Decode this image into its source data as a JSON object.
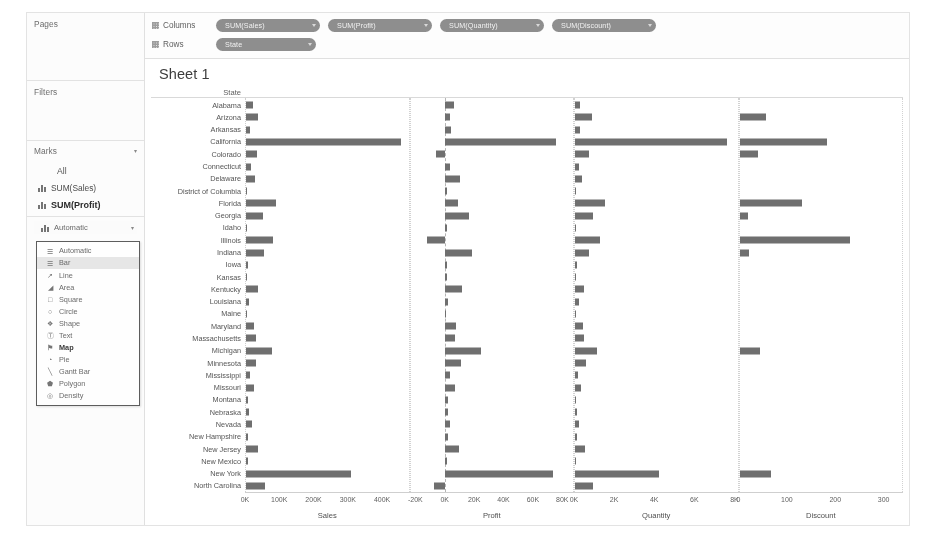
{
  "window": {
    "sheet_title": "Sheet 1"
  },
  "sidebar": {
    "pages": {
      "label": "Pages"
    },
    "filters": {
      "label": "Filters"
    },
    "marks": {
      "label": "Marks",
      "caret": "▾",
      "tabs": [
        {
          "label": "All",
          "icon": "none"
        },
        {
          "label": "SUM(Sales)",
          "icon": "bar-chart-icon"
        },
        {
          "label": "SUM(Profit)",
          "icon": "bar-chart-icon"
        }
      ],
      "marktype_selected": "Automatic",
      "marktype_caret": "▾",
      "dropdown_options": [
        {
          "label": "Automatic",
          "icon": "☰",
          "icon_name": "bar-chart-icon"
        },
        {
          "label": "Bar",
          "icon": "☰",
          "icon_name": "bar-icon",
          "highlighted": true
        },
        {
          "label": "Line",
          "icon": "↗",
          "icon_name": "line-icon"
        },
        {
          "label": "Area",
          "icon": "◢",
          "icon_name": "area-icon"
        },
        {
          "label": "Square",
          "icon": "□",
          "icon_name": "square-icon"
        },
        {
          "label": "Circle",
          "icon": "○",
          "icon_name": "circle-icon"
        },
        {
          "label": "Shape",
          "icon": "❖",
          "icon_name": "shape-icon"
        },
        {
          "label": "Text",
          "icon": "Ⓣ",
          "icon_name": "text-icon"
        },
        {
          "label": "Map",
          "icon": "⚑",
          "icon_name": "map-icon",
          "bold": true
        },
        {
          "label": "Pie",
          "icon": "◔",
          "icon_name": "pie-icon"
        },
        {
          "label": "Gantt Bar",
          "icon": "╲",
          "icon_name": "gantt-bar-icon"
        },
        {
          "label": "Polygon",
          "icon": "⬟",
          "icon_name": "polygon-icon"
        },
        {
          "label": "Density",
          "icon": "◎",
          "icon_name": "density-icon"
        }
      ]
    }
  },
  "shelves": {
    "columns": {
      "label": "Columns",
      "pills": [
        "SUM(Sales)",
        "SUM(Profit)",
        "SUM(Quantity)",
        "SUM(Discount)"
      ]
    },
    "rows": {
      "label": "Rows",
      "pills": [
        "State"
      ]
    }
  },
  "viz": {
    "row_header": "State",
    "bar_color": "#6f6f6f"
  },
  "chart_data": {
    "type": "bar",
    "title": "Sheet 1",
    "orientation": "horizontal",
    "grid": false,
    "legend": "none",
    "row_field": "State",
    "categories": [
      "Alabama",
      "Arizona",
      "Arkansas",
      "California",
      "Colorado",
      "Connecticut",
      "Delaware",
      "District of Columbia",
      "Florida",
      "Georgia",
      "Idaho",
      "Illinois",
      "Indiana",
      "Iowa",
      "Kansas",
      "Kentucky",
      "Louisiana",
      "Maine",
      "Maryland",
      "Massachusetts",
      "Michigan",
      "Minnesota",
      "Mississippi",
      "Missouri",
      "Montana",
      "Nebraska",
      "Nevada",
      "New Hampshire",
      "New Jersey",
      "New Mexico",
      "New York",
      "North Carolina"
    ],
    "panels": [
      {
        "name": "Sales",
        "xlabel": "Sales",
        "ticks": [
          "0K",
          "100K",
          "200K",
          "300K",
          "400K"
        ],
        "tick_values": [
          0,
          100000,
          200000,
          300000,
          400000
        ],
        "xlim": [
          0,
          480000
        ],
        "values": [
          19511,
          35282,
          11678,
          457688,
          32108,
          13384,
          27451,
          2865,
          89474,
          49095,
          4382,
          80166,
          53555,
          4580,
          2914,
          36592,
          9217,
          1270,
          23706,
          28634,
          76270,
          29863,
          10772,
          22205,
          5589,
          7465,
          16729,
          7293,
          35764,
          4697,
          310876,
          55603
        ]
      },
      {
        "name": "Profit",
        "xlabel": "Profit",
        "ticks": [
          "-20K",
          "0K",
          "20K",
          "40K",
          "60K",
          "80K"
        ],
        "tick_values": [
          -20000,
          0,
          20000,
          40000,
          60000,
          80000
        ],
        "xlim": [
          -24000,
          88000
        ],
        "values": [
          5787,
          3480,
          4008,
          76381,
          -6528,
          3511,
          9978,
          1060,
          8989,
          16250,
          827,
          -12608,
          18382,
          1183,
          836,
          11200,
          2196,
          454,
          7031,
          6786,
          24463,
          10823,
          3173,
          6436,
          1833,
          2037,
          3317,
          1706,
          9773,
          1157,
          74039,
          -7491
        ]
      },
      {
        "name": "Quantity",
        "xlabel": "Quantity",
        "ticks": [
          "0K",
          "2K",
          "4K",
          "6K",
          "8K"
        ],
        "tick_values": [
          0,
          2000,
          4000,
          6000,
          8000
        ],
        "xlim": [
          0,
          8200
        ],
        "values": [
          256,
          862,
          240,
          7667,
          697,
          202,
          361,
          46,
          1510,
          906,
          57,
          1286,
          716,
          92,
          60,
          478,
          180,
          23,
          399,
          430,
          1097,
          534,
          176,
          311,
          59,
          93,
          222,
          80,
          504,
          74,
          4224,
          899
        ]
      },
      {
        "name": "Discount",
        "xlabel": "Discount",
        "ticks": [
          "0",
          "100",
          "200",
          "300"
        ],
        "tick_values": [
          0,
          100,
          200,
          300
        ],
        "xlim": [
          0,
          340
        ],
        "values": [
          0,
          56,
          0,
          184,
          39,
          0,
          0,
          0,
          130,
          17,
          0,
          232,
          19,
          0,
          0,
          0,
          0,
          0,
          0,
          0,
          43,
          0,
          0,
          0,
          0,
          0,
          0,
          0,
          0,
          0,
          66,
          0
        ]
      }
    ]
  }
}
